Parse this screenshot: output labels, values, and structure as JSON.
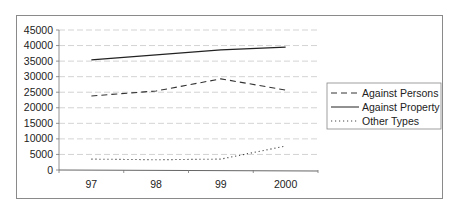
{
  "chart_data": {
    "type": "line",
    "title": "",
    "xlabel": "",
    "ylabel": "",
    "categories": [
      "97",
      "98",
      "99",
      "2000"
    ],
    "ylim": [
      0,
      45000
    ],
    "yticks": [
      0,
      5000,
      10000,
      15000,
      20000,
      25000,
      30000,
      35000,
      40000,
      45000
    ],
    "ytick_labels": [
      "0",
      "5000",
      "10000",
      "15000",
      "20000",
      "25000",
      "30000",
      "35000",
      "40000",
      "45000"
    ],
    "grid": true,
    "legend_position": "right",
    "series": [
      {
        "name": "Against Persons",
        "style": "dashed",
        "color": "#333333",
        "values": [
          23800,
          25400,
          29300,
          25700
        ]
      },
      {
        "name": "Against Property",
        "style": "solid",
        "color": "#222222",
        "values": [
          35400,
          37000,
          38600,
          39500
        ]
      },
      {
        "name": "Other Types",
        "style": "dotted",
        "color": "#444444",
        "values": [
          3500,
          3300,
          3500,
          7700
        ]
      }
    ]
  }
}
